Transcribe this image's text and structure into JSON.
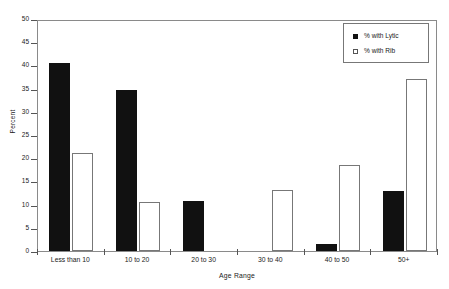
{
  "chart_data": {
    "type": "bar",
    "title": "",
    "xlabel": "Age Range",
    "ylabel": "Percent",
    "categories": [
      "Less than 10",
      "10 to 20",
      "20 to 30",
      "30 to 40",
      "40 to 50",
      "50+"
    ],
    "series": [
      {
        "name": "% with Lytic",
        "marker": "filled-square",
        "color": "#111111",
        "values": [
          40.6,
          34.7,
          10.8,
          0,
          1.5,
          13.0
        ]
      },
      {
        "name": "% with Rib",
        "marker": "open-square",
        "color": "#ffffff",
        "values": [
          21.2,
          10.6,
          0,
          13.2,
          18.5,
          37.0
        ]
      }
    ],
    "ylim": [
      0,
      50
    ],
    "yticks": [
      0,
      5,
      10,
      15,
      20,
      25,
      30,
      35,
      40,
      45,
      50
    ],
    "ytick_labels": [
      "0",
      "5",
      "10",
      "15",
      "20",
      "25",
      "30",
      "35",
      "40",
      "45",
      "50"
    ],
    "grid": false,
    "legend_position": "top-right"
  },
  "legend": {
    "entries": [
      {
        "label": "% with Lytic"
      },
      {
        "label": "% with Rib"
      }
    ]
  },
  "axes": {
    "x_title": "Age Range",
    "y_title": "Percent"
  }
}
